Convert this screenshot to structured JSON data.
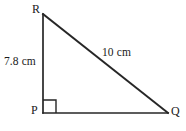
{
  "figure": {
    "type": "right-triangle",
    "background_color": "#ffffff",
    "stroke_color": "#262626",
    "text_color": "#1a1a1a"
  },
  "vertices": [
    {
      "name": "R",
      "label": "R",
      "x": 43,
      "y": 14,
      "label_x": 32,
      "label_y": 3
    },
    {
      "name": "P",
      "label": "P",
      "x": 43,
      "y": 113,
      "label_x": 31,
      "label_y": 104
    },
    {
      "name": "Q",
      "label": "Q",
      "x": 168,
      "y": 113,
      "label_x": 171,
      "label_y": 105
    }
  ],
  "sides": [
    {
      "name": "leg-pr",
      "from": "P",
      "to": "R",
      "label": "7.8 cm",
      "value": 7.8,
      "unit": "cm",
      "label_x": 4,
      "label_y": 56
    },
    {
      "name": "hypotenuse-rq",
      "from": "R",
      "to": "Q",
      "label": "10 cm",
      "value": 10,
      "unit": "cm",
      "label_x": 102,
      "label_y": 47
    },
    {
      "name": "leg-pq",
      "from": "P",
      "to": "Q",
      "label": "",
      "value": null,
      "unit": "cm",
      "label_x": null,
      "label_y": null
    }
  ],
  "angle_markers": [
    {
      "name": "right-angle-at-p",
      "vertex": "P",
      "type": "square",
      "size": 13,
      "degrees": 90
    }
  ]
}
